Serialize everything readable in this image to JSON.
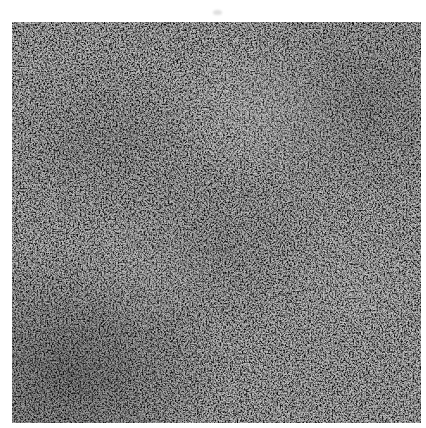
{
  "page": {
    "width": 426,
    "height": 428,
    "background_color": "#ffffff",
    "content_type": "grayscale-micrograph",
    "caption_text": "",
    "has_scale_bar": false,
    "has_axis_labels": false,
    "has_text_annotations": false
  },
  "figure": {
    "name": "electron-micrograph",
    "alt_text": "Grayscale electron micrograph of a fine granular nanoporous surface",
    "x": 12,
    "y": 22,
    "width": 409,
    "height": 401,
    "border_color": "#d8d8d8",
    "palette": {
      "darkest": "#060606",
      "dark": "#1b1b1b",
      "mid_dark": "#4a4a4a",
      "mid": "#6e6e6e",
      "mid_light": "#8f8f8f",
      "light": "#b4b4b4",
      "lightest": "#d2d2d2"
    },
    "texture": {
      "description": "dense isotropic granular aggregate of bright grains separated by dark interstitial channels",
      "mean_gray_level": 103,
      "min_gray_level": 8,
      "max_gray_level": 206,
      "grain_size_px": 5,
      "contrast": "high",
      "anisotropy": "none",
      "brightness_gradient": "slightly darker toward lower-left, slightly brighter upper-centre"
    },
    "noise_layers": [
      {
        "name": "fine-grain",
        "base_frequency": 0.62,
        "octaves": 4,
        "seed": 17,
        "opacity": 1.0,
        "contrast_slope": 3.4,
        "contrast_intercept": -0.72
      },
      {
        "name": "medium-grain",
        "base_frequency": 0.26,
        "octaves": 4,
        "seed": 41,
        "opacity": 0.62,
        "contrast_slope": 2.6,
        "contrast_intercept": -0.58
      },
      {
        "name": "coarse-blobs",
        "base_frequency": 0.11,
        "octaves": 3,
        "seed": 73,
        "opacity": 0.4,
        "contrast_slope": 2.0,
        "contrast_intercept": -0.45
      },
      {
        "name": "speckle",
        "base_frequency": 1.1,
        "octaves": 2,
        "seed": 5,
        "opacity": 0.3,
        "contrast_slope": 2.2,
        "contrast_intercept": -0.55
      }
    ]
  },
  "artifact": {
    "name": "scan-artifact",
    "x": 213,
    "y": 10,
    "visible": true
  }
}
